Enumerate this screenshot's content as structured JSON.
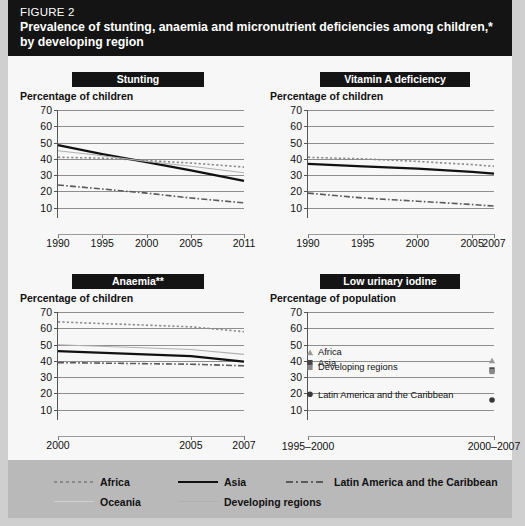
{
  "header": {
    "figure_number": "FIGURE 2",
    "title": "Prevalence of stunting, anaemia and micronutrient deficiencies among children,* by developing region",
    "title_line1": "Prevalence of stunting, anaemia and micronutrient deficiencies among children,*",
    "title_line2": "by developing region"
  },
  "legend": {
    "items": [
      {
        "label": "Africa",
        "style": "dotted",
        "color": "#8a8a8a"
      },
      {
        "label": "Asia",
        "style": "solid-thick",
        "color": "#111111"
      },
      {
        "label": "Latin America and the Caribbean",
        "style": "dash-dot",
        "color": "#5a5a5a"
      },
      {
        "label": "Oceania",
        "style": "solid-thin-light",
        "color": "#d2d2d2"
      },
      {
        "label": "Developing regions",
        "style": "solid-thin-grey",
        "color": "#b0b0b0"
      }
    ]
  },
  "chart_data": [
    {
      "type": "line",
      "title": "Stunting",
      "ylabel": "Percentage of children",
      "xlabel": "",
      "ylim": [
        0,
        75
      ],
      "yticks": [
        10,
        20,
        30,
        40,
        50,
        60,
        70
      ],
      "xlim": [
        1990,
        2011
      ],
      "xticks": [
        1990,
        1995,
        2000,
        2005,
        2011
      ],
      "xticklabels": [
        "1990",
        "1995",
        "2000",
        "2005",
        "2011"
      ],
      "grid": true,
      "series": [
        {
          "name": "Africa",
          "style": "dotted",
          "color": "#8a8a8a",
          "x": [
            1990,
            1995,
            2000,
            2005,
            2011
          ],
          "values": [
            41,
            40.5,
            39,
            37.5,
            35
          ]
        },
        {
          "name": "Asia",
          "style": "solid-thick",
          "color": "#111111",
          "x": [
            1990,
            1995,
            2000,
            2005,
            2011
          ],
          "values": [
            48.5,
            43,
            38,
            33,
            26.5
          ]
        },
        {
          "name": "Latin America and the Caribbean",
          "style": "dash-dot",
          "color": "#5a5a5a",
          "x": [
            1990,
            1995,
            2000,
            2005,
            2011
          ],
          "values": [
            24,
            21.5,
            19,
            16,
            13
          ]
        },
        {
          "name": "Developing regions",
          "style": "solid-thin-grey",
          "color": "#b0b0b0",
          "x": [
            1990,
            1995,
            2000,
            2005,
            2011
          ],
          "values": [
            45,
            42,
            38.5,
            35.5,
            31.5
          ]
        }
      ]
    },
    {
      "type": "line",
      "title": "Vitamin A deficiency",
      "ylabel": "Percentage of children",
      "xlabel": "",
      "ylim": [
        0,
        75
      ],
      "yticks": [
        10,
        20,
        30,
        40,
        50,
        60,
        70
      ],
      "xlim": [
        1990,
        2007
      ],
      "xticks": [
        1990,
        1995,
        2000,
        2005,
        2007
      ],
      "xticklabels": [
        "1990",
        "1995",
        "2000",
        "2005",
        "2007"
      ],
      "grid": true,
      "series": [
        {
          "name": "Africa",
          "style": "dotted",
          "color": "#8a8a8a",
          "x": [
            1990,
            1995,
            2000,
            2005,
            2007
          ],
          "values": [
            41,
            40,
            38.5,
            36.5,
            35.5
          ]
        },
        {
          "name": "Asia",
          "style": "solid-thick",
          "color": "#111111",
          "x": [
            1990,
            1995,
            2000,
            2005,
            2007
          ],
          "values": [
            37,
            35.5,
            34,
            32,
            31
          ]
        },
        {
          "name": "Latin America and the Caribbean",
          "style": "dash-dot",
          "color": "#5a5a5a",
          "x": [
            1990,
            1995,
            2000,
            2005,
            2007
          ],
          "values": [
            19,
            16,
            14,
            12,
            11
          ]
        }
      ]
    },
    {
      "type": "line",
      "title": "Anaemia**",
      "ylabel": "Percentage of children",
      "xlabel": "",
      "ylim": [
        0,
        75
      ],
      "yticks": [
        10,
        20,
        30,
        40,
        50,
        60,
        70
      ],
      "xlim": [
        2000,
        2007
      ],
      "xticks": [
        2000,
        2005,
        2007
      ],
      "xticklabels": [
        "2000",
        "2005",
        "2007"
      ],
      "grid": true,
      "series": [
        {
          "name": "Africa",
          "style": "dotted",
          "color": "#8a8a8a",
          "x": [
            2000,
            2005,
            2007
          ],
          "values": [
            64,
            61,
            58
          ]
        },
        {
          "name": "Asia",
          "style": "solid-thick",
          "color": "#111111",
          "x": [
            2000,
            2005,
            2007
          ],
          "values": [
            46,
            43,
            39.5
          ]
        },
        {
          "name": "Latin America and the Caribbean",
          "style": "dash-dot",
          "color": "#5a5a5a",
          "x": [
            2000,
            2005,
            2007
          ],
          "values": [
            39,
            38,
            37
          ]
        },
        {
          "name": "Developing regions",
          "style": "solid-thin-grey",
          "color": "#b0b0b0",
          "x": [
            2000,
            2005,
            2007
          ],
          "values": [
            50,
            47,
            44
          ]
        }
      ]
    },
    {
      "type": "scatter",
      "title": "Low urinary iodine",
      "ylabel": "Percentage of population",
      "xlabel": "",
      "ylim": [
        0,
        75
      ],
      "yticks": [
        10,
        20,
        30,
        40,
        50,
        60,
        70
      ],
      "xticks": [
        0,
        1
      ],
      "xticklabels": [
        "1995–2000",
        "2000–2007"
      ],
      "grid": true,
      "points": [
        {
          "name": "Africa",
          "marker": "triangle",
          "color": "#9a9a9a",
          "values": [
            45,
            40
          ],
          "label": "Africa",
          "label_y": 45.5
        },
        {
          "name": "Asia",
          "marker": "square",
          "color": "#444444",
          "values": [
            39,
            34.5
          ],
          "label": "Asia",
          "label_y": 39
        },
        {
          "name": "Developing regions",
          "marker": "square",
          "color": "#888888",
          "values": [
            36,
            33.5
          ],
          "label": "Developing regions",
          "label_y": 36
        },
        {
          "name": "Latin America and the Caribbean",
          "marker": "circle",
          "color": "#3a3a3a",
          "values": [
            19.5,
            16
          ],
          "label": "Latin America and the Caribbean",
          "label_y": 19
        }
      ]
    }
  ]
}
